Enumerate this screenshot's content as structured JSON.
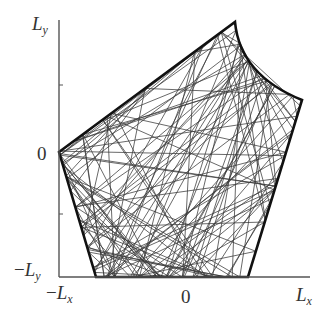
{
  "figure": {
    "type": "billiard trajectory diagram",
    "axis_labels": {
      "y_top": {
        "base": "L",
        "sub": "y"
      },
      "y_zero": "0",
      "y_bottom": {
        "prefix": "−",
        "base": "L",
        "sub": "y"
      },
      "x_left": {
        "prefix": "−",
        "base": "L",
        "sub": "x"
      },
      "x_zero": "0",
      "x_right": {
        "base": "L",
        "sub": "x"
      }
    },
    "colors": {
      "boundary": "#111111",
      "trajectory": "#3a3a3a",
      "axis": "#555555",
      "background": "#ffffff"
    },
    "boundary_vertices": [
      [
        59,
        152
      ],
      [
        235,
        22
      ],
      [
        302,
        100
      ],
      [
        248,
        277
      ],
      [
        96,
        277
      ]
    ],
    "trajectory_segments": 120,
    "random_seed": 7
  }
}
